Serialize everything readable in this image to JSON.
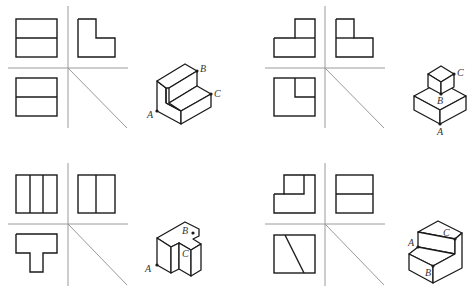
{
  "diagram": {
    "type": "three-view orthographic projections with isometric solids",
    "background": "#ffffff",
    "line_color": "#1a1a1a",
    "axis_color": "#9a9a9a",
    "panels": [
      {
        "id": "top-left",
        "views": {
          "front": "rectangle split by one horizontal line",
          "side": "L-shape (tall left, step down right)",
          "top": "rectangle split by one horizontal line"
        },
        "labels": {
          "A": "A",
          "B": "B",
          "C": "C"
        }
      },
      {
        "id": "top-right",
        "views": {
          "front": "inverted-T step: small block on right of base",
          "side": "L-shape: small block on left of base",
          "top": "square with small square in top-right corner"
        },
        "labels": {
          "A": "A",
          "B": "B",
          "C": "C"
        }
      },
      {
        "id": "bottom-left",
        "views": {
          "front": "rectangle split into three vertical strips",
          "side": "rectangle split into two vertical strips",
          "top": "T-shape"
        },
        "labels": {
          "A": "A",
          "B": "B",
          "C": "C"
        }
      },
      {
        "id": "bottom-right",
        "views": {
          "front": "L-shape with inner square at top",
          "side": "rectangle split by one horizontal line",
          "top": "square with diagonal line"
        },
        "labels": {
          "A": "A",
          "B": "B",
          "C": "C"
        }
      }
    ]
  }
}
